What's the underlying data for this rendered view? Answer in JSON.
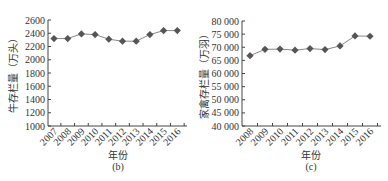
{
  "chart_data": [
    {
      "type": "line",
      "panel_label": "(b)",
      "title": "",
      "xlabel": "年份",
      "ylabel": "牛存栏量（万头）",
      "categories": [
        "2007",
        "2008",
        "2009",
        "2010",
        "2011",
        "2012",
        "2013",
        "2014",
        "2015",
        "2016"
      ],
      "values": [
        2320,
        2320,
        2390,
        2380,
        2310,
        2280,
        2280,
        2380,
        2440,
        2440
      ],
      "ylim": [
        1000,
        2600
      ],
      "yticks": [
        1000,
        1200,
        1400,
        1600,
        1800,
        2000,
        2200,
        2400,
        2600
      ],
      "ytick_labels": [
        "1000",
        "1200",
        "1400",
        "1600",
        "1800",
        "2000",
        "2200",
        "2400",
        "2600"
      ],
      "marker": "diamond",
      "grid": false,
      "legend": null
    },
    {
      "type": "line",
      "panel_label": "(c)",
      "title": "",
      "xlabel": "年份",
      "ylabel": "家禽存栏量（万羽）",
      "categories": [
        "2008",
        "2009",
        "2010",
        "2011",
        "2012",
        "2013",
        "2014",
        "2015",
        "2016"
      ],
      "values": [
        66800,
        69200,
        69300,
        68900,
        69500,
        69100,
        70500,
        74300,
        74200
      ],
      "ylim": [
        40000,
        80000
      ],
      "yticks": [
        40000,
        45000,
        50000,
        55000,
        60000,
        65000,
        70000,
        75000,
        80000
      ],
      "ytick_labels": [
        "40 000",
        "45 000",
        "50 000",
        "55 000",
        "60 000",
        "65 000",
        "70 000",
        "75 000",
        "80 000"
      ],
      "marker": "diamond",
      "grid": false,
      "legend": null
    }
  ],
  "colors": {
    "line": "#888888",
    "marker": "#555555",
    "axis": "#444444",
    "text": "#333333"
  }
}
